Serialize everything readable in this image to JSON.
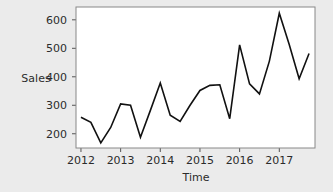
{
  "chart_data": {
    "type": "line",
    "title": "",
    "xlabel": "Time",
    "ylabel": "Sales",
    "xlim": [
      2011.875,
      2017.9
    ],
    "ylim": [
      150,
      645
    ],
    "grid": false,
    "legend": null,
    "xticks": [
      2012,
      2013,
      2014,
      2015,
      2016,
      2017
    ],
    "xticklabels": [
      "2012",
      "2013",
      "2014",
      "2015",
      "2016",
      "2017"
    ],
    "yticks": [
      200,
      300,
      400,
      500,
      600
    ],
    "yticklabels": [
      "200",
      "300",
      "400",
      "500",
      "600"
    ],
    "series": [
      {
        "name": "Sales",
        "x": [
          2012.0,
          2012.25,
          2012.5,
          2012.75,
          2013.0,
          2013.25,
          2013.5,
          2013.75,
          2014.0,
          2014.25,
          2014.5,
          2014.75,
          2015.0,
          2015.25,
          2015.5,
          2015.75,
          2016.0,
          2016.25,
          2016.5,
          2016.75,
          2017.0,
          2017.25,
          2017.5,
          2017.75
        ],
        "values": [
          258,
          240,
          168,
          222,
          305,
          300,
          188,
          282,
          378,
          265,
          243,
          300,
          352,
          370,
          372,
          253,
          512,
          375,
          340,
          455,
          623,
          513,
          393,
          482
        ],
        "color": "#111111"
      }
    ]
  },
  "axis": {
    "ylabel_text": "Sales",
    "xlabel_text": "Time"
  },
  "colors": {
    "background": "#ebebeb",
    "plot_background": "#ffffff",
    "line": "#111111",
    "frame": "#888888",
    "text": "#2b2b2b"
  }
}
